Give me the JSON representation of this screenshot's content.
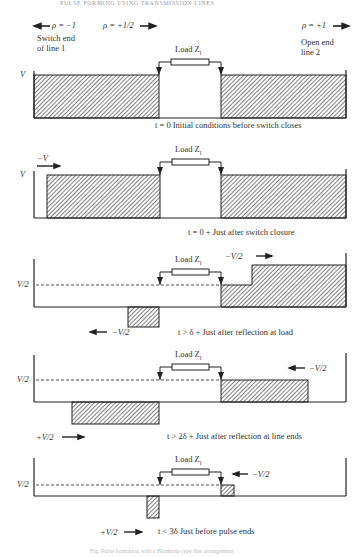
{
  "header": {
    "running_head": "PULSE FORMING USING TRANSMISSION LINES"
  },
  "top_labels": {
    "rho_left": "ρ = −1",
    "rho_mid": "ρ = +1/2",
    "rho_right": "ρ = +1",
    "switch_end_line1": "Switch end",
    "switch_end_line2": "of line 1",
    "open_end_line1": "Open end",
    "open_end_line2": "line 2"
  },
  "load_label": "Load Z",
  "load_subscript": "l",
  "panels": [
    {
      "y_label": "V",
      "caption": "t = 0 Initial conditions before switch closes",
      "wave_labels": []
    },
    {
      "y_label": "V",
      "caption": "t = 0 + Just after switch closure",
      "wave_labels": [
        "−V"
      ]
    },
    {
      "y_label": "V/2",
      "caption": "t > δ + Just after reflection at load",
      "wave_labels": [
        "−V/2",
        "−V/2"
      ]
    },
    {
      "y_label": "V/2",
      "caption": "t > 2δ + Just after reflection at line ends",
      "wave_labels": [
        "−V/2",
        "+V/2"
      ]
    },
    {
      "y_label": "V/2",
      "caption": "t < 3δ  Just before pulse ends",
      "wave_labels": [
        "−V/2",
        "+V/2"
      ]
    }
  ],
  "footer": {
    "caption_fragment": "Fig. Pulse formation with a Blumlein-type line arrangement"
  },
  "colors": {
    "line": "#2a2a2a",
    "hatch": "#3a3a3a",
    "background": "#ffffff"
  }
}
